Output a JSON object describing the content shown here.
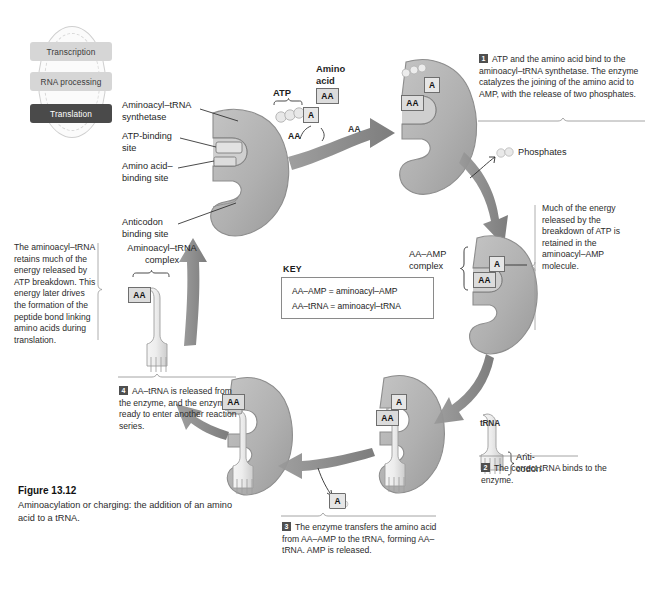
{
  "figure": {
    "number": "Figure 13.12",
    "caption": "Aminoacylation or charging: the addition of an amino acid to a tRNA."
  },
  "cycle_thumbnail": {
    "items": [
      {
        "label": "Transcription",
        "active": false
      },
      {
        "label": "RNA processing",
        "active": false
      },
      {
        "label": "Translation",
        "active": true
      }
    ]
  },
  "enzyme_labels": {
    "synthetase": "Aminoacyl–tRNA\nsynthetase",
    "synthetase_line1": "Aminoacyl–tRNA",
    "synthetase_line2": "synthetase",
    "atp_site_line1": "ATP-binding",
    "atp_site_line2": "site",
    "aa_site_line1": "Amino acid–",
    "aa_site_line2": "binding site",
    "anticodon_site_line1": "Anticodon",
    "anticodon_site_line2": "binding site"
  },
  "molecules": {
    "atp": "ATP",
    "amino_acid_line1": "Amino",
    "amino_acid_line2": "acid",
    "aa_tag": "AA",
    "a_tag": "A",
    "amp_tag": "A",
    "phosphates": "Phosphates",
    "trna": "tRNA",
    "anticodon_line1": "Anti-",
    "anticodon_line2": "codon"
  },
  "complex_labels": {
    "aa_amp_line1": "AA–AMP",
    "aa_amp_line2": "complex",
    "aminoacyl_trna_line1": "Aminoacyl–tRNA",
    "aminoacyl_trna_line2": "complex"
  },
  "key": {
    "title": "KEY",
    "lines": [
      "AA–AMP = aminoacyl–AMP",
      "AA–tRNA = aminoacyl–tRNA"
    ]
  },
  "steps": [
    {
      "number": "1",
      "text": "ATP and the amino acid bind to the aminoacyl–tRNA synthetase. The enzyme catalyzes the joining of the amino acid to AMP, with the release of two phosphates."
    },
    {
      "number": "2",
      "text": "The correct tRNA binds to the enzyme."
    },
    {
      "number": "3",
      "text": "The enzyme transfers the amino acid from AA–AMP to the tRNA, forming AA–tRNA. AMP is released."
    },
    {
      "number": "4",
      "text": "AA–tRNA is released from the enzyme, and the enzyme is ready to enter another reaction series."
    }
  ],
  "side_notes": {
    "energy_left": "The aminoacyl–tRNA retains much of the energy released by ATP breakdown. This energy later drives the formation of the peptide bond linking amino acids during translation.",
    "energy_right": "Much of the energy released by the breakdown of ATP is retained in the aminoacyl–AMP molecule."
  },
  "colors": {
    "enzyme_fill": "#b3b3b3",
    "enzyme_stroke": "#8a8a8a",
    "trna_fill": "#e8e8e8",
    "arrow_fill": "#8c8c8c",
    "tag_fill": "#dcdcdc",
    "accent_dark": "#4a4a4a",
    "text": "#2b2b2b"
  }
}
